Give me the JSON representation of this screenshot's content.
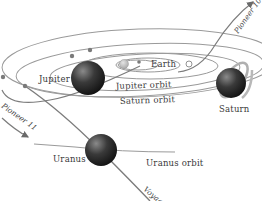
{
  "diagram": {
    "planets": [
      {
        "name": "Earth",
        "label": "Earth"
      },
      {
        "name": "Jupiter",
        "label": "Jupiter"
      },
      {
        "name": "Saturn",
        "label": "Saturn"
      },
      {
        "name": "Uranus",
        "label": "Uranus"
      }
    ],
    "orbits": [
      {
        "label": "Jupiter orbit"
      },
      {
        "label": "Saturn orbit"
      },
      {
        "label": "Uranus orbit"
      }
    ],
    "trajectories": [
      {
        "label": "Pioneer 10"
      },
      {
        "label": "Pioneer 11"
      },
      {
        "label": "Voyager"
      }
    ],
    "colors": {
      "line": "#8a8a8a",
      "planet_dark": "#1e1e1e",
      "text": "#3a3a3a",
      "background": "#ffffff"
    }
  }
}
